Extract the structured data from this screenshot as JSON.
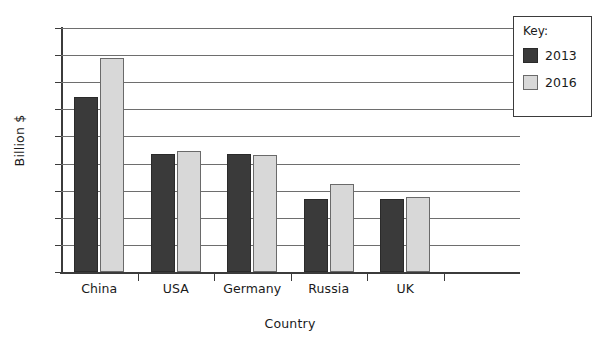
{
  "chart_data": {
    "type": "bar",
    "title": "",
    "xlabel": "Country",
    "ylabel": "Billion $",
    "categories": [
      "China",
      "USA",
      "Germany",
      "Russia",
      "UK",
      ""
    ],
    "series": [
      {
        "name": "2013",
        "color": "#3a3a3a",
        "values": [
          129,
          87,
          87,
          54,
          54,
          null
        ]
      },
      {
        "name": "2016",
        "color": "#d8d8d8",
        "values": [
          158,
          89,
          86,
          65,
          55,
          null
        ]
      }
    ],
    "ylim": [
      0,
      180
    ],
    "ytick_step": 20,
    "yticks": [
      0,
      20,
      40,
      60,
      80,
      100,
      120,
      140,
      160,
      180
    ],
    "ytick_labels": [
      "0",
      "20",
      "40",
      "60",
      "80",
      "100",
      "120",
      "140",
      "160",
      "180"
    ],
    "grid": true,
    "grid_axis": "y",
    "legend_position": "top-right"
  },
  "legend": {
    "title": "Key:",
    "entries": [
      {
        "label": "2013",
        "color": "#3a3a3a"
      },
      {
        "label": "2016",
        "color": "#d8d8d8"
      }
    ]
  },
  "colors": {
    "series_2013": "#3a3a3a",
    "series_2016": "#d8d8d8",
    "axis": "#3b3b3b",
    "gridline": "#6e6e6e",
    "background": "#ffffff"
  }
}
